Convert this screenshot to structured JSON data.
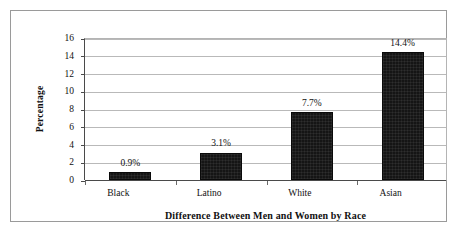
{
  "chart_data": {
    "type": "bar",
    "title": "",
    "xlabel": "Difference Between Men and Women by Race",
    "ylabel": "Percentage",
    "categories": [
      "Black",
      "Latino",
      "White",
      "Asian"
    ],
    "values": [
      0.9,
      3.1,
      7.7,
      14.4
    ],
    "data_labels": [
      "0.9%",
      "3.1%",
      "7.7%",
      "14.4%"
    ],
    "ylim": [
      0,
      16
    ],
    "yticks": [
      0,
      2,
      4,
      6,
      8,
      10,
      12,
      14,
      16
    ],
    "ytick_labels": [
      "0",
      "2",
      "4",
      "6",
      "8",
      "10",
      "12",
      "14",
      "16"
    ],
    "grid": true,
    "grid_axis": "y",
    "legend": false,
    "legend_position": "none",
    "bar_color": "#151515",
    "gridline_color": "#b9b9b9",
    "axis_color": "#4a4a4a",
    "frame_color": "#9a9a9a",
    "background": "#ffffff"
  }
}
